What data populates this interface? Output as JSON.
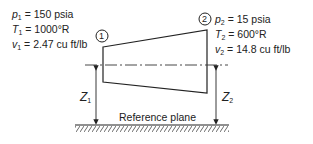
{
  "state1": {
    "marker": "1",
    "lines": [
      {
        "symbol": "p",
        "sub": "1",
        "value": "= 150 psia"
      },
      {
        "symbol": "T",
        "sub": "1",
        "value": "= 1000°R"
      },
      {
        "symbol": "v",
        "sub": "1",
        "value": "= 2.47 cu ft/lb"
      }
    ]
  },
  "state2": {
    "marker": "2",
    "lines": [
      {
        "symbol": "p",
        "sub": "2",
        "value": "= 15 psia"
      },
      {
        "symbol": "T",
        "sub": "2",
        "value": "= 600°R"
      },
      {
        "symbol": "v",
        "sub": "2",
        "value": "= 14.8 cu ft/lb"
      }
    ]
  },
  "elevations": {
    "z1": {
      "symbol": "Z",
      "sub": "1"
    },
    "z2": {
      "symbol": "Z",
      "sub": "2"
    }
  },
  "reference_label": "Reference plane"
}
